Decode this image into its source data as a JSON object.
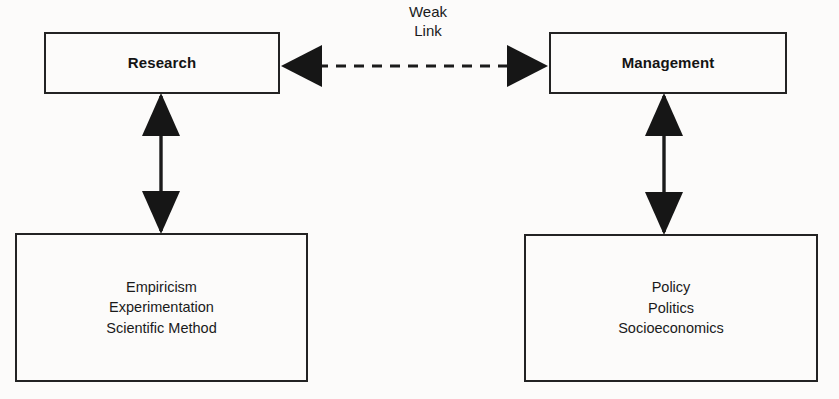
{
  "diagram": {
    "background_color": "#fcfbfa",
    "line_color": "#1b1b1b",
    "text_color": "#141414",
    "nodes": {
      "research": {
        "label": "Research",
        "bold": true
      },
      "management": {
        "label": "Management",
        "bold": true
      },
      "research_basis": {
        "lines": [
          "Empiricism",
          "Experimentation",
          "Scientific Method"
        ],
        "line1": "Empiricism",
        "line2": "Experimentation",
        "line3": "Scientific Method"
      },
      "management_basis": {
        "lines": [
          "Policy",
          "Politics",
          "Socioeconomics"
        ],
        "line1": "Policy",
        "line2": "Politics",
        "line3": "Socioeconomics"
      }
    },
    "connectors": {
      "weak_link": {
        "label_line1": "Weak",
        "label_line2": "Link",
        "style": "dashed",
        "arrows": "double",
        "from": "research",
        "to": "management"
      },
      "research_link": {
        "style": "solid",
        "arrows": "double",
        "from": "research",
        "to": "research_basis"
      },
      "management_link": {
        "style": "solid",
        "arrows": "double",
        "from": "management",
        "to": "management_basis"
      }
    }
  }
}
